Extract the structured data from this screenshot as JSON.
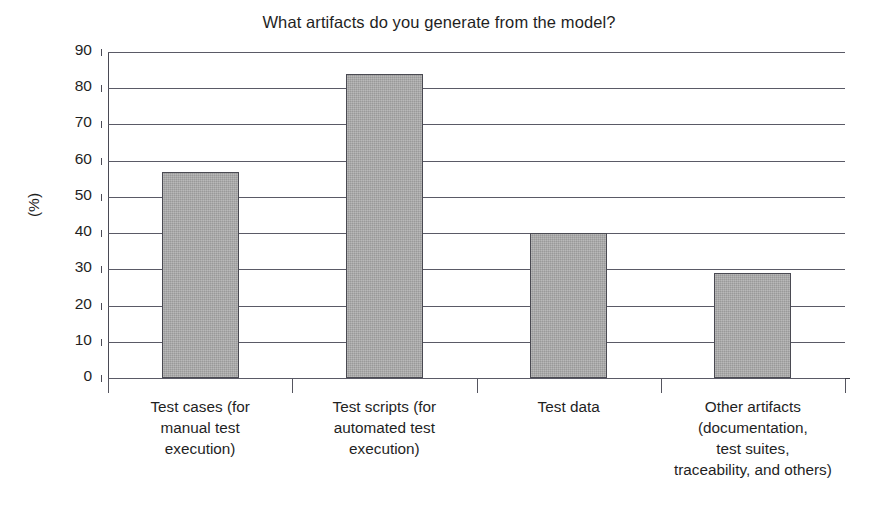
{
  "chart_data": {
    "type": "bar",
    "title": "What artifacts do you generate from the model?",
    "xlabel": "",
    "ylabel": "(%)",
    "ylim": [
      0,
      90
    ],
    "ytick_step": 10,
    "grid": true,
    "legend": "none",
    "categories": [
      "Test cases (for\nmanual test\nexecution)",
      "Test scripts (for\nautomated test\nexecution)",
      "Test data",
      "Other artifacts\n(documentation,\ntest suites,\ntraceability, and others)"
    ],
    "values": [
      57,
      84,
      40,
      29
    ],
    "ytick_labels": [
      "90",
      "80",
      "70",
      "60",
      "50",
      "40",
      "30",
      "20",
      "10",
      "0"
    ],
    "bar_fill_color": "#a9a9a9",
    "bar_border_color": "#4a4a52",
    "gridline_color": "#5a5a66",
    "axis_color": "#3a3a44",
    "text_color": "#1f1f1f",
    "background_color": "#ffffff"
  }
}
